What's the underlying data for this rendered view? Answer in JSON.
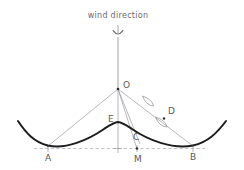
{
  "diagram": {
    "title": "wind direction",
    "canvas": {
      "width": 244,
      "height": 170,
      "background": "#ffffff"
    },
    "colors": {
      "wave": "#1d1d1f",
      "thin_line": "#9a9aa0",
      "dashed_baseline": "#a6a6ac",
      "label_text": "#58585c",
      "title_text": "#6a6a6e"
    },
    "labels": {
      "O": "O",
      "A": "A",
      "B": "B",
      "C": "C",
      "D": "D",
      "E": "E",
      "M": "M"
    },
    "points": {
      "O": {
        "x": 118,
        "y": 89
      },
      "A": {
        "x": 48,
        "y": 146
      },
      "B": {
        "x": 193,
        "y": 146
      },
      "C": {
        "x": 139,
        "y": 143
      },
      "D": {
        "x": 164,
        "y": 118
      },
      "E": {
        "x": 118,
        "y": 122
      },
      "M": {
        "x": 137,
        "y": 148
      }
    },
    "baseline_y": 148,
    "arrow": {
      "name": "wind-direction-arrow",
      "direction": "down",
      "x": 118,
      "y_start": 25,
      "y_end": 88
    },
    "angle_markers": [
      {
        "name": "angle-marker-upper",
        "cx": 148,
        "cy": 101
      },
      {
        "name": "angle-marker-lower",
        "cx": 161,
        "cy": 122
      }
    ]
  }
}
